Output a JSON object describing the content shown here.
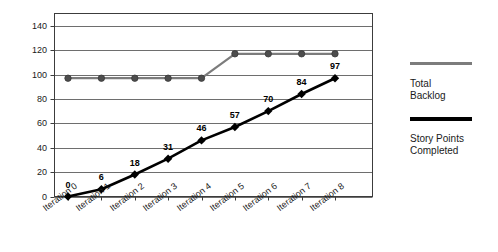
{
  "chart_data": {
    "type": "line",
    "title": "",
    "xlabel": "",
    "ylabel": "",
    "categories": [
      "Iteration 0",
      "Iteration 1",
      "Iteration 2",
      "Iteration 3",
      "Iteration 4",
      "Iteration 5",
      "Iteration 6",
      "Iteration 7",
      "Iteration 8"
    ],
    "ylim": [
      0,
      150
    ],
    "yticks": [
      0,
      20,
      40,
      60,
      80,
      100,
      120,
      140
    ],
    "ytick_labels": [
      "0",
      "20",
      "40",
      "60",
      "80",
      "100",
      "120",
      "140"
    ],
    "grid": "horizontal",
    "legend_position": "right",
    "series": [
      {
        "name": "Total Backlog",
        "color": "#7c7c7c",
        "marker": "circle",
        "show_labels": false,
        "values": [
          97,
          97,
          97,
          97,
          97,
          117,
          117,
          117,
          117
        ]
      },
      {
        "name": "Story Points Completed",
        "color": "#000000",
        "marker": "diamond",
        "show_labels": true,
        "values": [
          0,
          6,
          18,
          31,
          46,
          57,
          70,
          84,
          97
        ],
        "value_labels": [
          "0",
          "6",
          "18",
          "31",
          "46",
          "57",
          "70",
          "84",
          "97"
        ]
      }
    ]
  },
  "legend": {
    "entries": [
      {
        "label": "Total Backlog",
        "color": "#7c7c7c"
      },
      {
        "label": "Story Points Completed",
        "color": "#000000"
      }
    ]
  }
}
